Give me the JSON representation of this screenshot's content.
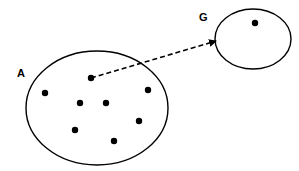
{
  "diagram": {
    "sets": [
      {
        "id": "A",
        "label": "A",
        "cx": 97,
        "cy": 108,
        "rx": 71,
        "ry": 57,
        "label_x": 17,
        "label_y": 77,
        "points": [
          [
            45,
            93
          ],
          [
            91,
            78
          ],
          [
            80,
            103
          ],
          [
            106,
            103
          ],
          [
            148,
            90
          ],
          [
            139,
            121
          ],
          [
            75,
            130
          ],
          [
            114,
            141
          ]
        ]
      },
      {
        "id": "G",
        "label": "G",
        "cx": 253,
        "cy": 39,
        "rx": 38,
        "ry": 30,
        "label_x": 199,
        "label_y": 21,
        "points": [
          [
            255,
            23
          ]
        ]
      }
    ],
    "arrow": {
      "from": [
        91,
        78
      ],
      "to": [
        216,
        41
      ],
      "style": "dashed"
    },
    "colors": {
      "stroke": "#000000",
      "background": "#ffffff"
    }
  }
}
